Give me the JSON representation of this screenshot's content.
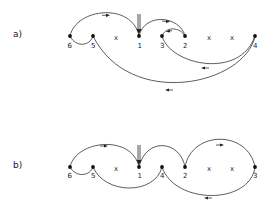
{
  "panels": [
    {
      "label": "a)",
      "nodes": [
        {
          "id": "6",
          "x": 70
        },
        {
          "id": "5",
          "x": 93
        },
        {
          "id": "1",
          "x": 139
        },
        {
          "id": "3",
          "x": 162
        },
        {
          "id": "2",
          "x": 185
        },
        {
          "id": "4",
          "x": 255
        }
      ],
      "crosses": [
        "x",
        "x",
        "x"
      ],
      "edges": [
        "6→1 (over)",
        "6–5 (under)",
        "1→2 (over)",
        "2→3 (over)",
        "3→4 (under)",
        "4→5 (under)"
      ],
      "injection": "double arrow into 1"
    },
    {
      "label": "b)",
      "nodes": [
        {
          "id": "6",
          "x": 70
        },
        {
          "id": "5",
          "x": 93
        },
        {
          "id": "1",
          "x": 139
        },
        {
          "id": "4",
          "x": 162
        },
        {
          "id": "2",
          "x": 185
        },
        {
          "id": "3",
          "x": 255
        }
      ],
      "crosses": [
        "x",
        "x",
        "x"
      ],
      "edges": [
        "6→1 (over)",
        "6–5 (under)",
        "1–2 (over)",
        "2→3 (over)",
        "5–4 (under)",
        "4→3 (under)"
      ],
      "injection": "double arrow into 1"
    }
  ]
}
